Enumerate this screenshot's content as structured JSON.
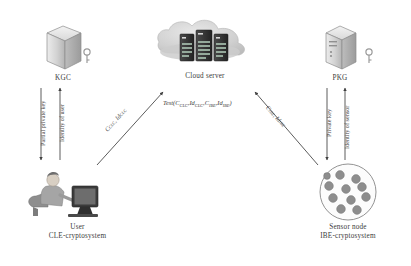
{
  "diagram": {
    "background": "#ffffff",
    "nodes": [
      {
        "id": "kgc",
        "label": "KGC",
        "icon": "server-box-icon",
        "x": 63,
        "y": 45
      },
      {
        "id": "cloud",
        "label": "Cloud server",
        "icon": "cloud-servers-icon",
        "x": 205,
        "y": 45
      },
      {
        "id": "pkg",
        "label": "PKG",
        "icon": "server-tower-icon",
        "x": 340,
        "y": 45
      },
      {
        "id": "user",
        "label": "User",
        "label2": "CLE-cryptosystem",
        "icon": "user-at-computer-icon",
        "x": 75,
        "y": 195
      },
      {
        "id": "sensor",
        "label": "Sensor node",
        "label2": "IBE-cryptosystem",
        "icon": "sensor-network-icon",
        "x": 348,
        "y": 192
      }
    ],
    "edges": [
      {
        "id": "kgc-to-user",
        "label": "Partial private key",
        "from": "kgc",
        "to": "user",
        "direction": "down"
      },
      {
        "id": "user-to-kgc",
        "label": "Identity of user",
        "from": "user",
        "to": "kgc",
        "direction": "up"
      },
      {
        "id": "user-to-cloud",
        "label": "C",
        "label_sub1": "CLC",
        "label_mid": ", Id",
        "label_sub2": "CLC",
        "from": "user",
        "to": "cloud",
        "direction": "up-right"
      },
      {
        "id": "sensor-to-cloud",
        "label": "C",
        "label_sub1": "IBE",
        "label_mid": ", Id",
        "label_sub2": "IBE",
        "from": "sensor",
        "to": "cloud",
        "direction": "up-left"
      },
      {
        "id": "pkg-to-sensor",
        "label": "Private key",
        "from": "pkg",
        "to": "sensor",
        "direction": "down"
      },
      {
        "id": "sensor-to-pkg",
        "label": "Identity of sensor",
        "from": "sensor",
        "to": "pkg",
        "direction": "up"
      }
    ],
    "formula": {
      "name": "Test",
      "open": "(",
      "arg1": "C",
      "arg1_sub": "CLC",
      "sep1": ",",
      "arg2": "Id",
      "arg2_sub": "CLC",
      "sep2": ",",
      "arg3": "C",
      "arg3_sub": "IBE",
      "sep3": ",",
      "arg4": "Id",
      "arg4_sub": "IBE",
      "close": ")",
      "full": "Test(C_CLC, Id_CLC, C_IBE, Id_IBE)"
    },
    "colors": {
      "line": "#555555",
      "text": "#3a3a3a",
      "box_light": "#e2e2e2",
      "box_mid": "#c6c6c6",
      "box_dark": "#a8a8a8",
      "cloud": "#cfcfcf",
      "server_dark": "#3c3c3c",
      "sensor_dot": "#8a8a8a"
    }
  }
}
